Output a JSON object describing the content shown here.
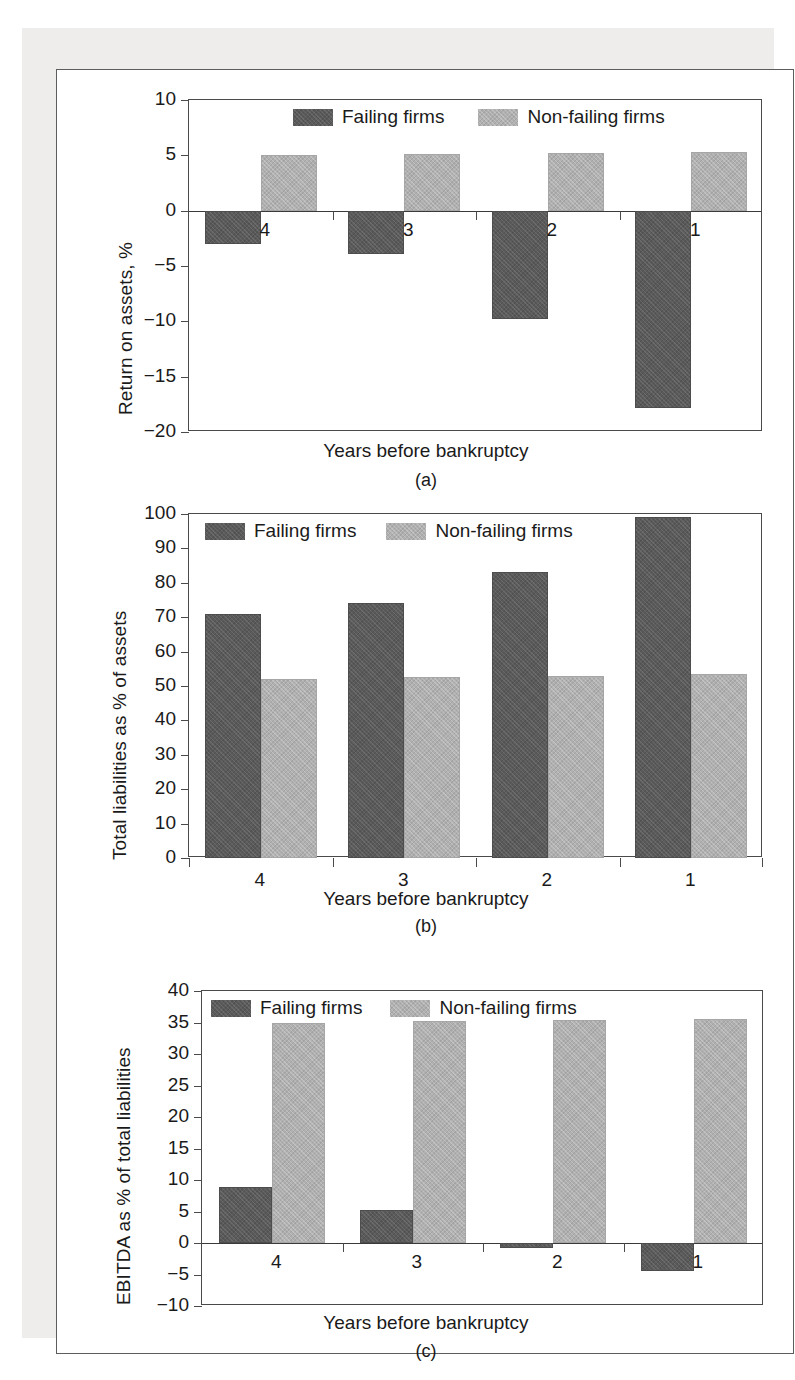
{
  "figure": {
    "panels": [
      "a",
      "b",
      "c"
    ],
    "shared_xlabel": "Years before bankruptcy",
    "legend": {
      "series": [
        {
          "name": "Failing firms",
          "color": "#5a5a5a"
        },
        {
          "name": "Non-failing firms",
          "color": "#b0b0b0"
        }
      ]
    }
  },
  "chart_data": [
    {
      "id": "a",
      "type": "bar",
      "title": "",
      "caption": "(a)",
      "xlabel": "Years before bankruptcy",
      "ylabel": "Return on assets, %",
      "categories": [
        "4",
        "3",
        "2",
        "1"
      ],
      "series": [
        {
          "name": "Failing firms",
          "color": "#5a5a5a",
          "values": [
            -3.0,
            -3.9,
            -9.8,
            -17.8
          ]
        },
        {
          "name": "Non-failing firms",
          "color": "#b0b0b0",
          "values": [
            5.0,
            5.1,
            5.2,
            5.3
          ]
        }
      ],
      "ylim": [
        -20,
        10
      ],
      "yticks": [
        10,
        5,
        0,
        -5,
        -10,
        -15,
        -20
      ],
      "ytick_labels": [
        "10",
        "5",
        "0",
        "−5",
        "−10",
        "−15",
        "−20"
      ],
      "grid": false,
      "legend_position": "top-center-inside",
      "category_labels_inside_plot": true
    },
    {
      "id": "b",
      "type": "bar",
      "title": "",
      "caption": "(b)",
      "xlabel": "Years before bankruptcy",
      "ylabel": "Total liabilities as % of assets",
      "categories": [
        "4",
        "3",
        "2",
        "1"
      ],
      "series": [
        {
          "name": "Failing firms",
          "color": "#5a5a5a",
          "values": [
            71,
            74,
            83,
            99
          ]
        },
        {
          "name": "Non-failing firms",
          "color": "#b0b0b0",
          "values": [
            52,
            52.5,
            53,
            53.5
          ]
        }
      ],
      "ylim": [
        0,
        100
      ],
      "yticks": [
        100,
        90,
        80,
        70,
        60,
        50,
        40,
        30,
        20,
        10,
        0
      ],
      "ytick_labels": [
        "100",
        "90",
        "80",
        "70",
        "60",
        "50",
        "40",
        "30",
        "20",
        "10",
        "0"
      ],
      "grid": false,
      "legend_position": "top-left-inside",
      "category_labels_inside_plot": false
    },
    {
      "id": "c",
      "type": "bar",
      "title": "",
      "caption": "(c)",
      "xlabel": "Years before bankruptcy",
      "ylabel": "EBITDA as % of total liabilities",
      "categories": [
        "4",
        "3",
        "2",
        "1"
      ],
      "series": [
        {
          "name": "Failing firms",
          "color": "#5a5a5a",
          "values": [
            8.9,
            5.2,
            -0.8,
            -4.5
          ]
        },
        {
          "name": "Non-failing firms",
          "color": "#b0b0b0",
          "values": [
            35.0,
            35.2,
            35.4,
            35.6
          ]
        }
      ],
      "ylim": [
        -10,
        40
      ],
      "yticks": [
        40,
        35,
        30,
        25,
        20,
        15,
        10,
        5,
        0,
        -5,
        -10
      ],
      "ytick_labels": [
        "40",
        "35",
        "30",
        "25",
        "20",
        "15",
        "10",
        "5",
        "0",
        "−5",
        "−10"
      ],
      "grid": false,
      "legend_position": "top-left-inside",
      "category_labels_inside_plot": true
    }
  ]
}
